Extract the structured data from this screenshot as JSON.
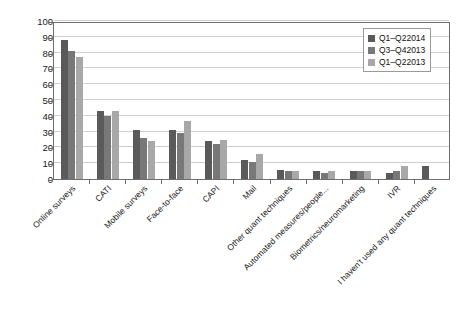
{
  "chart_data": {
    "type": "bar",
    "title": "",
    "subtitle": "",
    "xlabel": "",
    "ylabel": "",
    "ylim": [
      0,
      100
    ],
    "ytick_step": 10,
    "yticks": [
      0,
      10,
      20,
      30,
      40,
      50,
      60,
      70,
      80,
      90,
      100
    ],
    "grid": true,
    "legend_position": "top-right",
    "orientation": "vertical",
    "grouping": "grouped",
    "categories": [
      "Online surveys",
      "CATI",
      "Mobile surveys",
      "Face-to-face",
      "CAPI",
      "Mail",
      "Other quant techniques",
      "Automated measures/people...",
      "Biometrics/neuromarketing",
      "IVR",
      "I haven't used any quant techniques"
    ],
    "series": [
      {
        "name": "Q1–Q22014",
        "color": "#5a5a5a",
        "values": [
          88,
          43,
          31,
          31,
          24,
          12,
          6,
          5,
          5,
          4,
          8
        ]
      },
      {
        "name": "Q3–Q42013",
        "color": "#787878",
        "values": [
          81,
          40,
          26,
          29,
          22,
          11,
          5,
          4,
          5,
          5,
          0
        ]
      },
      {
        "name": "Q1–Q22013",
        "color": "#a8a8a8",
        "values": [
          77,
          43,
          24,
          37,
          25,
          16,
          5,
          5,
          5,
          8,
          0
        ]
      }
    ]
  },
  "legend": {
    "items": [
      {
        "label": "Q1–Q22014",
        "color": "#5a5a5a"
      },
      {
        "label": "Q3–Q42013",
        "color": "#787878"
      },
      {
        "label": "Q1–Q22013",
        "color": "#a8a8a8"
      }
    ]
  },
  "axis": {
    "y_tick_labels": [
      "100",
      "90",
      "80",
      "70",
      "60",
      "50",
      "40",
      "30",
      "20",
      "10",
      "0"
    ]
  }
}
